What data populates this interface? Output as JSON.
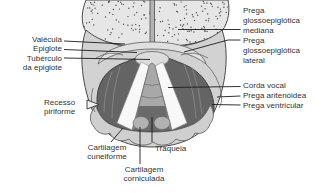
{
  "palette": {
    "background": "#ffffff",
    "outline": "#4a4a4a",
    "leader_line": "#1c1c1c",
    "text": "#333333",
    "tongue": "#e6e6e6",
    "pharynx_body": "#d2d2d2",
    "epiglottis": "#e0e0e0",
    "inlet_dark": "#646464",
    "vocal_cord": "#f8f8f8",
    "trachea_column": "#a8a8a8",
    "cartilage_collar": "#cfcfcf"
  },
  "labels": {
    "left": {
      "valecula": "Valécula",
      "epiglote": "Epiglote",
      "tuberculo_1": "Tubérculo",
      "tuberculo_2": "da epiglote",
      "recesso_1": "Recesso",
      "recesso_2": "piriforme"
    },
    "bottom": {
      "cuneiforme_1": "Cartilagem",
      "cuneiforme_2": "cuneiforme",
      "traqueia": "Traqueia",
      "corniculada_1": "Cartilagem",
      "corniculada_2": "corniculada"
    },
    "right": {
      "mediana_1": "Prega",
      "mediana_2": "glossoepiglótica",
      "mediana_3": "mediana",
      "lateral_1": "Prega",
      "lateral_2": "glossoepiglótica",
      "lateral_3": "lateral",
      "corda_vocal": "Corda vocal",
      "aritenoidea": "Prega aritenóidea",
      "ventricular": "Prega ventricular"
    }
  }
}
